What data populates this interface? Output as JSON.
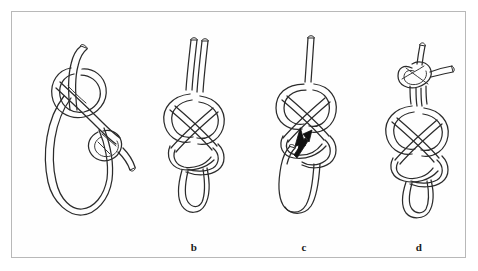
{
  "figure": {
    "background_color": "#ffffff",
    "frame_color": "#b8b8b8",
    "line_color": "#2b2b2b",
    "panel_count": 4
  },
  "panels": [
    {
      "id": "a",
      "label": "",
      "name": "knot-step-a",
      "description": "Loose overhand-style loop with working end crossing over, long bight hanging below"
    },
    {
      "id": "b",
      "label": "b",
      "name": "knot-step-b",
      "description": "Figure-eight knot tied in doubled rope, two standing parts rising above, bight loop below"
    },
    {
      "id": "c",
      "label": "c",
      "name": "knot-step-c",
      "description": "Figure-eight knot with single standing end above and free bight below, arrow indicating tuck direction"
    },
    {
      "id": "d",
      "label": "d",
      "name": "knot-step-d",
      "description": "Completed figure-eight loop with additional overhand backup knot at the top"
    }
  ],
  "annotations": [
    {
      "type": "arrow",
      "panel": "c",
      "name": "direction-arrow",
      "direction": "up-right",
      "color": "#111111"
    }
  ]
}
